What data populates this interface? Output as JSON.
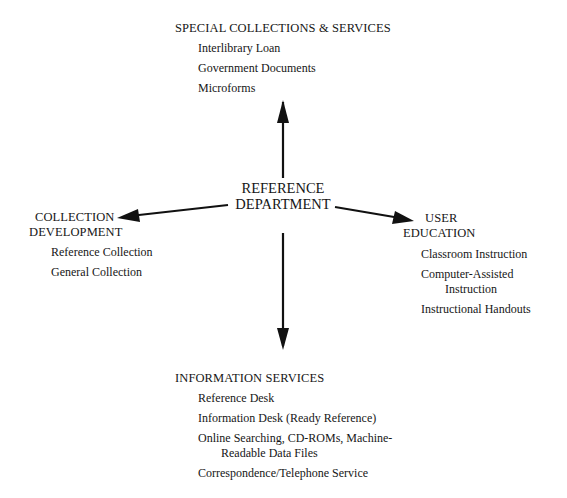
{
  "diagram": {
    "center": {
      "line1": "REFERENCE",
      "line2": "DEPARTMENT"
    },
    "top": {
      "heading": "SPECIAL COLLECTIONS & SERVICES",
      "items": [
        "Interlibrary Loan",
        "Government Documents",
        "Microforms"
      ]
    },
    "left": {
      "heading_line1": "COLLECTION",
      "heading_line2": "DEVELOPMENT",
      "items": [
        "Reference Collection",
        "General Collection"
      ]
    },
    "right": {
      "heading_line1": "USER",
      "heading_line2": "EDUCATION",
      "items": [
        "Classroom Instruction",
        "Computer-Assisted",
        "Instruction",
        "Instructional Handouts"
      ]
    },
    "bottom": {
      "heading": "INFORMATION SERVICES",
      "items": [
        "Reference Desk",
        "Information Desk (Ready Reference)",
        "Online Searching, CD-ROMs, Machine-",
        "Readable Data Files",
        "Correspondence/Telephone Service"
      ]
    },
    "arrow_color": "#111111"
  }
}
